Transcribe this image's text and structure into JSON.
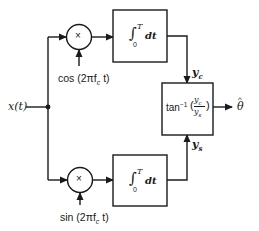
{
  "diagram": {
    "input": {
      "label": "x(t)"
    },
    "top_branch": {
      "multiplier_symbol": "×",
      "reference_label": "cos (2πf",
      "reference_sub": "c",
      "reference_tail": " t)",
      "integrator": {
        "integral": "∫",
        "lower": "0",
        "upper": "T",
        "dt": "dt"
      },
      "output_label": "y",
      "output_sub": "c"
    },
    "bottom_branch": {
      "multiplier_symbol": "×",
      "reference_label": "sin (2πf",
      "reference_sub": "c",
      "reference_tail": " t)",
      "integrator": {
        "integral": "∫",
        "lower": "0",
        "upper": "T",
        "dt": "dt"
      },
      "output_label": "y",
      "output_sub": "s"
    },
    "combiner": {
      "func": "tan",
      "exp": "−1",
      "num": "y",
      "num_sub": "c",
      "den": "y",
      "den_sub": "s"
    },
    "output": {
      "label": "θ",
      "accent": "^"
    },
    "colors": {
      "line": "#1a1a1a",
      "background": "#ffffff"
    }
  }
}
